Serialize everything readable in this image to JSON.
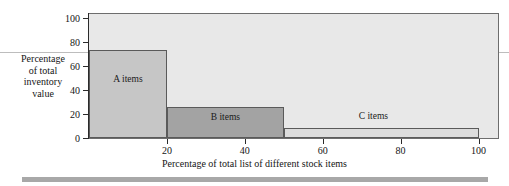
{
  "chart_data": {
    "type": "bar",
    "title": "",
    "subtitle": "",
    "xlabel": "Percentage of total list of different stock items",
    "ylabel": "Percentage of total inventory value",
    "ylabel_lines": [
      "Percentage",
      "of total",
      "inventory",
      "value"
    ],
    "xlim": [
      0,
      105
    ],
    "ylim": [
      0,
      103
    ],
    "grid": false,
    "legend_position": "none",
    "x_ticks": [
      20,
      40,
      60,
      80,
      100
    ],
    "x_tick_labels": [
      "20",
      "40",
      "60",
      "80",
      "100"
    ],
    "y_ticks": [
      0,
      20,
      40,
      60,
      80,
      100
    ],
    "y_tick_labels": [
      "0",
      "20",
      "40",
      "60",
      "80",
      "100"
    ],
    "categories": [
      "A items",
      "B items",
      "C items"
    ],
    "values": [
      73,
      26,
      8
    ],
    "bars": [
      {
        "label": "A items",
        "x_start": 0,
        "x_end": 20,
        "value": 73,
        "color": "#c6c6c6",
        "label_x": 10,
        "label_y": 45,
        "label_inside": true
      },
      {
        "label": "B items",
        "x_start": 20,
        "x_end": 50,
        "value": 26,
        "color": "#a3a3a3",
        "label_x": 35,
        "label_y": 13,
        "label_inside": true
      },
      {
        "label": "C items",
        "x_start": 50,
        "x_end": 100,
        "value": 8,
        "color": "#dcdcdc",
        "label_x": 73,
        "label_y": 14,
        "label_inside": false
      }
    ],
    "colors": {
      "plot_background": "#e8e8e8",
      "frame": "#6d6d6d",
      "axis": "#2b2b2b",
      "bar_a": "#c6c6c6",
      "bar_b": "#a3a3a3",
      "bar_c": "#dcdcdc",
      "bar_outline": "#5a5a5a",
      "bottom_band": "#a8a8a8",
      "page_rule": "#bdbdbd",
      "text": "#151515"
    }
  }
}
